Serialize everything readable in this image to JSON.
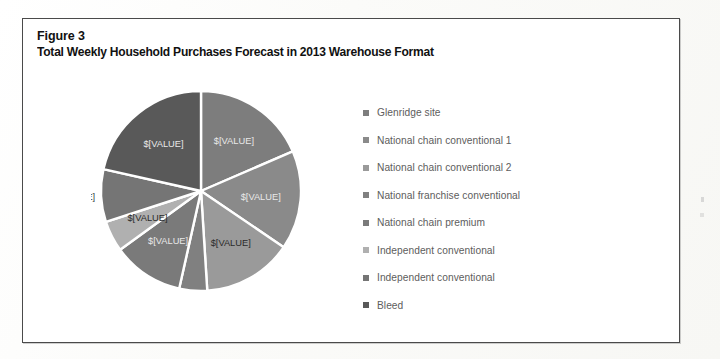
{
  "figure": {
    "number": "Figure 3",
    "title": "Total Weekly Household Purchases Forecast in 2013 Warehouse Format"
  },
  "legend": {
    "items": [
      {
        "label": "Glenridge site",
        "color": "#7d7d7d",
        "marker_icon": "legend-square-icon"
      },
      {
        "label": "National chain conventional 1",
        "color": "#8a8a8a",
        "marker_icon": "legend-square-icon"
      },
      {
        "label": "National chain conventional 2",
        "color": "#9a9a9a",
        "marker_icon": "legend-square-icon"
      },
      {
        "label": "National franchise conventional",
        "color": "#808080",
        "marker_icon": "legend-square-icon"
      },
      {
        "label": "National chain premium",
        "color": "#7a7a7a",
        "marker_icon": "legend-square-icon"
      },
      {
        "label": "Independent conventional",
        "color": "#b0b0b0",
        "marker_icon": "legend-square-icon"
      },
      {
        "label": "Independent conventional",
        "color": "#757575",
        "marker_icon": "legend-square-icon"
      },
      {
        "label": "Bleed",
        "color": "#595959",
        "marker_icon": "legend-square-icon"
      }
    ]
  },
  "chart_data": {
    "type": "pie",
    "title": "Total Weekly Household Purchases Forecast in 2013 Warehouse Format",
    "value_placeholder": "$[VALUE]",
    "start_angle_deg": 0,
    "direction": "clockwise",
    "legend_position": "right",
    "grid": false,
    "separator_color": "#ffffff",
    "categories": [
      "Glenridge site",
      "National chain conventional 1",
      "National chain conventional 2",
      "National franchise conventional",
      "National chain premium",
      "Independent conventional",
      "Independent conventional",
      "Bleed"
    ],
    "values": [
      18.5,
      16.0,
      14.5,
      4.5,
      11.5,
      5.0,
      8.5,
      21.5
    ],
    "colors": [
      "#7d7d7d",
      "#8a8a8a",
      "#9a9a9a",
      "#808080",
      "#7a7a7a",
      "#b0b0b0",
      "#757575",
      "#595959"
    ],
    "labels": [
      "$[VALUE]",
      "$[VALUE]",
      "$[VALUE]",
      "$[VALUE]",
      "$[VALUE]",
      "$[VALUE]",
      "$[VALUE]",
      "$[VALUE]"
    ],
    "label_placement": [
      "inside",
      "inside",
      "inside",
      "outside",
      "inside",
      "inside",
      "outside",
      "inside"
    ]
  }
}
